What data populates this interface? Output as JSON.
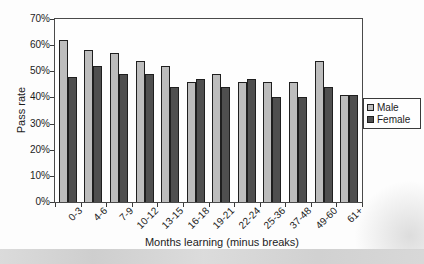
{
  "chart_data": {
    "type": "bar",
    "title": "",
    "xlabel": "Months learning (minus breaks)",
    "ylabel": "Pass rate",
    "categories": [
      "0-3",
      "4-6",
      "7-9",
      "10-12",
      "13-15",
      "16-18",
      "19-21",
      "22-24",
      "25-36",
      "37-48",
      "49-60",
      "61+"
    ],
    "series": [
      {
        "name": "Male",
        "color": "#bdbdbd",
        "values": [
          62,
          58,
          57,
          54,
          52,
          46,
          49,
          46,
          46,
          46,
          54,
          41
        ]
      },
      {
        "name": "Female",
        "color": "#4f4f4f",
        "values": [
          48,
          52,
          49,
          49,
          44,
          47,
          44,
          47,
          40,
          40,
          44,
          41
        ]
      }
    ],
    "ylim": [
      0,
      70
    ],
    "ytick_step": 10,
    "ytick_labels": [
      "0%",
      "10%",
      "20%",
      "30%",
      "40%",
      "50%",
      "60%",
      "70%"
    ],
    "grid": false,
    "legend_position": "right",
    "legend_entries": [
      "Male",
      "Female"
    ]
  },
  "colors": {
    "male_bar": "#bdbdbd",
    "female_bar": "#4f4f4f",
    "bar_border": "#1f1f1f",
    "axis": "#3a3a3a",
    "text": "#1c1c1c"
  }
}
